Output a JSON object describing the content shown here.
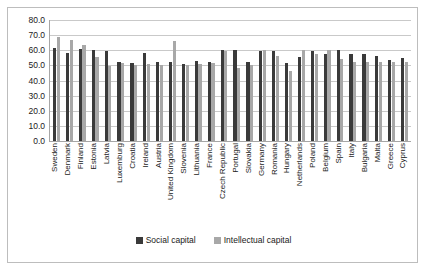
{
  "chart_data": {
    "type": "bar",
    "title": "",
    "subtitle": "",
    "xlabel": "",
    "ylabel": "",
    "ylim": [
      0.0,
      80.0
    ],
    "y_tick_labels": [
      "80.0",
      "70.0",
      "60.0",
      "50.0",
      "40.0",
      "30.0",
      "20.0",
      "10.0",
      "0.0"
    ],
    "y_ticks": [
      80.0,
      70.0,
      60.0,
      50.0,
      40.0,
      30.0,
      20.0,
      10.0,
      0.0
    ],
    "grid": true,
    "legend_position": "bottom",
    "categories": [
      "Sweden",
      "Denmark",
      "Finland",
      "Estonia",
      "Latvia",
      "Luxemburg",
      "Croatia",
      "Ireland",
      "Austria",
      "United Kingdom",
      "Slovenia",
      "Lithuania",
      "France",
      "Czech Republic",
      "Portugal",
      "Slovakia",
      "Germany",
      "Romania",
      "Hungary",
      "Netherlands",
      "Poland",
      "Belgium",
      "Spain",
      "Italy",
      "Bulgaria",
      "Malta",
      "Greece",
      "Cyprus"
    ],
    "series": [
      {
        "name": "Social capital",
        "color": "#3a3a3a",
        "values": [
          61.5,
          58.0,
          61.0,
          60.0,
          59.5,
          52.0,
          51.5,
          58.5,
          52.0,
          52.0,
          51.0,
          53.0,
          52.5,
          60.5,
          60.5,
          52.0,
          59.5,
          59.5,
          51.5,
          55.5,
          59.5,
          57.5,
          60.0,
          57.5,
          57.5,
          56.0,
          53.5,
          55.0
        ]
      },
      {
        "name": "Intellectual capital",
        "color": "#a8a8a8",
        "values": [
          68.5,
          66.5,
          63.5,
          55.5,
          49.5,
          51.5,
          50.5,
          51.0,
          50.5,
          66.0,
          50.5,
          51.0,
          51.5,
          59.5,
          48.0,
          50.5,
          60.5,
          56.5,
          46.5,
          60.5,
          57.5,
          60.0,
          54.5,
          52.5,
          52.0,
          52.5,
          52.0,
          52.5
        ]
      }
    ]
  },
  "legend": {
    "entries": [
      {
        "label": "Social capital",
        "color": "#3a3a3a"
      },
      {
        "label": "Intellectual capital",
        "color": "#a8a8a8"
      }
    ]
  }
}
